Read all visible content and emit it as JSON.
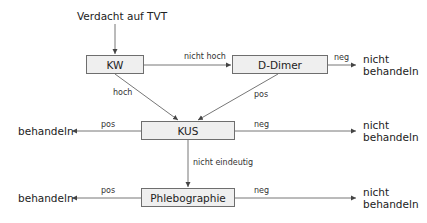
{
  "diagram": {
    "title": "Verdacht auf TVT",
    "nodes": {
      "kw": "KW",
      "ddimer": "D-Dimer",
      "kus": "KUS",
      "phlebo": "Phlebographie"
    },
    "edge_labels": {
      "kw_to_ddimer": "nicht hoch",
      "kw_to_kus": "hoch",
      "ddimer_to_kus": "pos",
      "ddimer_neg": "neg",
      "kus_pos": "pos",
      "kus_neg": "neg",
      "kus_to_phlebo": "nicht eindeutig",
      "phlebo_pos": "pos",
      "phlebo_neg": "neg"
    },
    "outcomes": {
      "ddimer_neg_line1": "nicht",
      "ddimer_neg_line2": "behandeln",
      "kus_pos": "behandeln",
      "kus_neg_line1": "nicht",
      "kus_neg_line2": "behandeln",
      "phlebo_pos": "behandeln",
      "phlebo_neg_line1": "nicht",
      "phlebo_neg_line2": "behandeln"
    },
    "colors": {
      "box_fill": "#efefef",
      "box_border": "#6e6e6e",
      "line": "#6e6e6e",
      "text": "#222222"
    }
  }
}
